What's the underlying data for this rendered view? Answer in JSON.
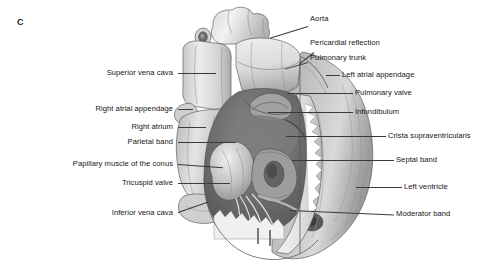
{
  "figure": {
    "panel_letter": "C",
    "style": "grayscale-medical-illustration",
    "background_color": "#ffffff",
    "ink_color": "#141414"
  },
  "labels_left": [
    {
      "text": "Superior vena cava",
      "name": "label-superior-vena-cava"
    },
    {
      "text": "Right atrial appendage",
      "name": "label-right-atrial-appendage"
    },
    {
      "text": "Right atrium",
      "name": "label-right-atrium"
    },
    {
      "text": "Parietal band",
      "name": "label-parietal-band"
    },
    {
      "text": "Papillary muscle of the conus",
      "name": "label-papillary-muscle-of-the-conus"
    },
    {
      "text": "Tricuspid valve",
      "name": "label-tricuspid-valve"
    },
    {
      "text": "Inferior vena cava",
      "name": "label-inferior-vena-cava"
    }
  ],
  "labels_right": [
    {
      "text": "Aorta",
      "name": "label-aorta"
    },
    {
      "text": "Pericardial reflection",
      "name": "label-pericardial-reflection"
    },
    {
      "text": "Pulmonary trunk",
      "name": "label-pulmonary-trunk"
    },
    {
      "text": "Left atrial appendage",
      "name": "label-left-atrial-appendage"
    },
    {
      "text": "Pulmonary valve",
      "name": "label-pulmonary-valve"
    },
    {
      "text": "Infundibulum",
      "name": "label-infundibulum"
    },
    {
      "text": "Crista supraventricularis",
      "name": "label-crista-supraventricularis"
    },
    {
      "text": "Septal band",
      "name": "label-septal-band"
    },
    {
      "text": "Left ventricle",
      "name": "label-left-ventricle"
    },
    {
      "text": "Moderator band",
      "name": "label-moderator-band"
    }
  ]
}
